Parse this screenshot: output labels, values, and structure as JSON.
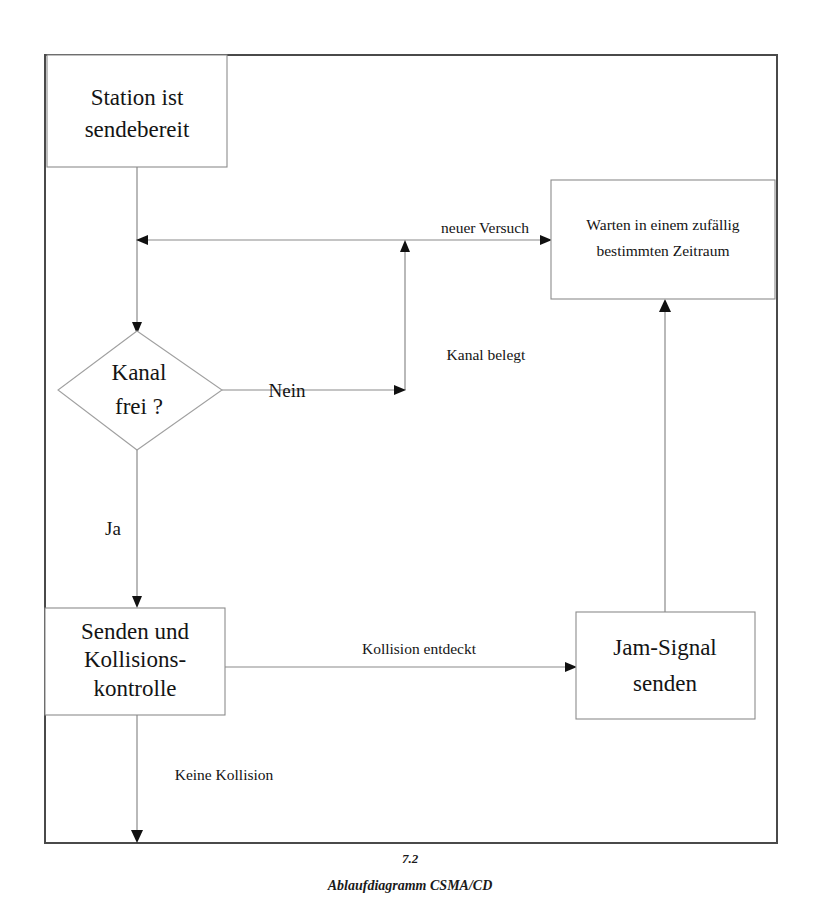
{
  "figure": {
    "number": "7.2",
    "caption": "Ablaufdiagramm CSMA/CD"
  },
  "nodes": {
    "start": {
      "line1": "Station ist",
      "line2": "sendebereit"
    },
    "wait": {
      "line1": "Warten in einem zufällig",
      "line2": "bestimmten Zeitraum"
    },
    "decision": {
      "line1": "Kanal",
      "line2": "frei ?"
    },
    "send": {
      "line1": "Senden und",
      "line2": "Kollisions-",
      "line3": "kontrolle"
    },
    "jam": {
      "line1": "Jam-Signal",
      "line2": "senden"
    }
  },
  "edge_labels": {
    "neuer_versuch": "neuer Versuch",
    "kanal_belegt": "Kanal belegt",
    "nein": "Nein",
    "ja": "Ja",
    "kollision_entdeckt": "Kollision entdeckt",
    "keine_kollision": "Keine Kollision"
  },
  "colors": {
    "frame_stroke": "#4a4a4a",
    "box_stroke": "#8c8c8c",
    "connector_stroke": "#8a8a8a",
    "arrow_fill": "#111111",
    "text": "#141414",
    "background": "#ffffff"
  }
}
